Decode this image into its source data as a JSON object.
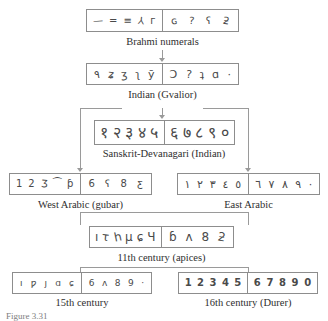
{
  "figure": {
    "bottom_caption": "Figure 3.31",
    "line_color": "#9a9a9a",
    "box_border_color": "#8d8d8d",
    "text_color": "#2e2e2e"
  },
  "rows": {
    "brahmi": {
      "label": "Brahmi numerals",
      "left_digits": [
        "—",
        "=",
        "≡",
        "⅄",
        "г"
      ],
      "right_digits": [
        "ɢ",
        "?",
        "ʕ",
        "ƻ"
      ]
    },
    "gvalior": {
      "label": "Indian (Gvalior)",
      "left_digits": [
        "٩",
        "ʑ",
        "ʒ",
        "ʅ",
        "ӯ"
      ],
      "right_digits": [
        "Ɔ",
        "?",
        "ʇ",
        "ɑ",
        "·"
      ]
    },
    "sanskrit": {
      "label": "Sanskrit-Devanagari (Indian)",
      "left_digits": [
        "१",
        "२",
        "३",
        "४",
        "५"
      ],
      "right_digits": [
        "६",
        "७",
        "८",
        "९",
        "०"
      ]
    },
    "west_arabic": {
      "label": "West Arabic (gubar)",
      "left_digits": [
        "1",
        "2",
        "Ʒ",
        "⁀",
        "ƥ"
      ],
      "right_digits": [
        "6",
        "ʕ",
        "8",
        "ƹ"
      ]
    },
    "east_arabic": {
      "label": "East Arabic",
      "left_digits": [
        "١",
        "٢",
        "٣",
        "٤",
        "٥"
      ],
      "right_digits": [
        "٦",
        "٧",
        "٨",
        "٩",
        "·"
      ]
    },
    "apices": {
      "label": "11th century (apices)",
      "left_digits": [
        "ı",
        "τ",
        "һ",
        "μ",
        "ɕ",
        "Ч"
      ],
      "right_digits": [
        "ɓ",
        "ʌ",
        "8",
        "ƻ"
      ]
    },
    "century15": {
      "label": "15th century",
      "left_digits": [
        "ı",
        "ƿ",
        "ȷ",
        "ɑ",
        "ɕ"
      ],
      "right_digits": [
        "6",
        "ʌ",
        "8",
        "9",
        "·"
      ]
    },
    "century16": {
      "label": "16th century (Durer)",
      "left_digits": [
        "1",
        "2",
        "3",
        "4",
        "5"
      ],
      "right_digits": [
        "6",
        "7",
        "8",
        "9",
        "0"
      ]
    }
  }
}
